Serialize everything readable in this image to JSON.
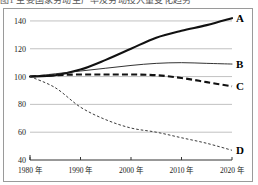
{
  "figure": {
    "caption_fragment": "图1 主要国家劳动生产率及劳动投入量变化趋势"
  },
  "chart_data": {
    "type": "line",
    "title": "",
    "xlabel": "",
    "ylabel": "",
    "x": [
      1980,
      1985,
      1990,
      1995,
      2000,
      2005,
      2010,
      2015,
      2020
    ],
    "xlim": [
      1980,
      2020
    ],
    "ylim": [
      40,
      145
    ],
    "yticks": [
      40,
      60,
      80,
      100,
      120,
      140
    ],
    "ytick_labels": [
      "40",
      "60",
      "80",
      "100",
      "120",
      "140"
    ],
    "xticks": [
      1980,
      1990,
      2000,
      2010,
      2020
    ],
    "xtick_labels": [
      "1980 年",
      "1990 年",
      "2000 年",
      "2010 年",
      "2020 年"
    ],
    "grid": true,
    "grid_axis": "y",
    "legend": "inline-right-endpoint-labels",
    "series": [
      {
        "name": "A",
        "label": "A",
        "style": "solid-thick",
        "color": "#111111",
        "values": [
          100,
          101,
          105,
          112,
          120,
          128,
          133,
          137,
          142
        ]
      },
      {
        "name": "B",
        "label": "B",
        "style": "solid-thin",
        "color": "#1c1c1c",
        "values": [
          100,
          102,
          104,
          106,
          108,
          109.5,
          110,
          109.5,
          109
        ]
      },
      {
        "name": "C",
        "label": "C",
        "style": "dashed-thick",
        "color": "#111111",
        "values": [
          100,
          101,
          101.5,
          101.5,
          101.5,
          101,
          99,
          96,
          93
        ]
      },
      {
        "name": "D",
        "label": "D",
        "style": "dotted-thin",
        "color": "#3a3a3a",
        "values": [
          100,
          92,
          78,
          69,
          63,
          60,
          56,
          52,
          47
        ]
      }
    ]
  }
}
